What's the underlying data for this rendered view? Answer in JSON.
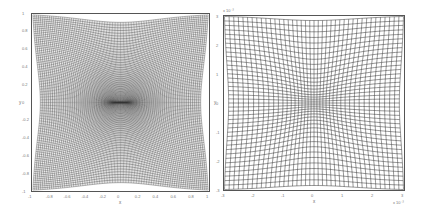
{
  "chart_data": [
    {
      "type": "line",
      "title": "",
      "description": "Dense deformed grid mesh, lines compressed toward origin (dark core), hyperbolic/saddle-shaped grid distortion",
      "xlabel": "x",
      "ylabel": "y",
      "xlim": [
        -1,
        1
      ],
      "ylim": [
        -1,
        1
      ],
      "xticks": [
        "-1",
        "-0.8",
        "-0.6",
        "-0.4",
        "-0.2",
        "0",
        "0.2",
        "0.4",
        "0.6",
        "0.8",
        "1"
      ],
      "yticks": [
        "1",
        "0.8",
        "0.6",
        "0.4",
        "0.2",
        "0",
        "-0.2",
        "-0.4",
        "-0.6",
        "-0.8",
        "-1"
      ],
      "grid_lines": 100,
      "line_color": "#333333"
    },
    {
      "type": "line",
      "title": "",
      "description": "Zoomed-in view of deformed grid near origin, saddle-shaped curved grid lines",
      "xlabel": "x",
      "ylabel": "y",
      "xlim": [
        -0.003,
        0.003
      ],
      "ylim": [
        -0.003,
        0.003
      ],
      "x_multiplier": "x 10^-3",
      "y_multiplier": "x 10^-3",
      "xticks": [
        "-3",
        "-2",
        "-1",
        "0",
        "1",
        "2",
        "3"
      ],
      "yticks": [
        "3",
        "2",
        "1",
        "0",
        "-1",
        "-2",
        "-3"
      ],
      "grid_lines": 40,
      "line_color": "#333333"
    }
  ],
  "left": {
    "xlabel": "x",
    "ylabel": "y",
    "xticks": [
      "-1",
      "-0.8",
      "-0.6",
      "-0.4",
      "-0.2",
      "0",
      "0.2",
      "0.4",
      "0.6",
      "0.8",
      "1"
    ],
    "yticks": [
      "1",
      "0.8",
      "0.6",
      "0.4",
      "0.2",
      "0",
      "-0.2",
      "-0.4",
      "-0.6",
      "-0.8",
      "-1"
    ]
  },
  "right": {
    "xlabel": "x",
    "ylabel": "y",
    "xticks": [
      "-3",
      "-2",
      "-1",
      "0",
      "1",
      "2",
      "3"
    ],
    "yticks": [
      "3",
      "2",
      "1",
      "0",
      "-1",
      "-2",
      "-3"
    ],
    "x_exp": "x 10⁻³",
    "y_exp": "x 10⁻³"
  }
}
